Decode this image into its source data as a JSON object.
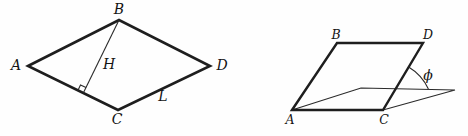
{
  "page": {
    "background": "#fefefe",
    "stroke_color": "#1e1e1e"
  },
  "left_figure": {
    "type": "rhombus-with-height",
    "labels": {
      "vertex_a": "A",
      "vertex_b": "B",
      "vertex_c": "C",
      "vertex_d": "D",
      "height": "H",
      "side": "L"
    }
  },
  "right_figure": {
    "type": "parallelogram-tilted-from-plane",
    "labels": {
      "vertex_a": "A",
      "vertex_b": "B",
      "vertex_c": "C",
      "vertex_d": "D",
      "angle": "ϕ"
    }
  }
}
